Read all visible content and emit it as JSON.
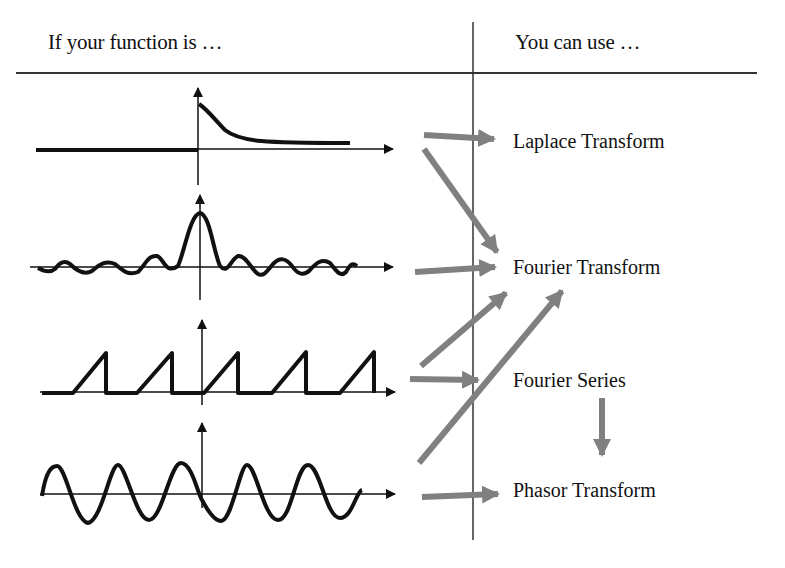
{
  "header": {
    "left": "If your function is …",
    "right": "You can use …"
  },
  "functions": [
    {
      "name": "decaying-exponential",
      "label": "One-sided decaying exponential (causal)"
    },
    {
      "name": "sinc",
      "label": "Sinc pulse (aperiodic)"
    },
    {
      "name": "periodic-sawtooth",
      "label": "Periodic sawtooth pulses"
    },
    {
      "name": "sinusoid",
      "label": "Sinusoid"
    }
  ],
  "transforms": [
    {
      "name": "laplace",
      "label": "Laplace Transform"
    },
    {
      "name": "fourier-transform",
      "label": "Fourier Transform"
    },
    {
      "name": "fourier-series",
      "label": "Fourier Series"
    },
    {
      "name": "phasor",
      "label": "Phasor Transform"
    }
  ],
  "arrows": [
    {
      "from": "decaying-exponential",
      "to": "laplace"
    },
    {
      "from": "decaying-exponential",
      "to": "fourier-transform"
    },
    {
      "from": "sinc",
      "to": "fourier-transform"
    },
    {
      "from": "periodic-sawtooth",
      "to": "fourier-transform"
    },
    {
      "from": "periodic-sawtooth",
      "to": "fourier-series"
    },
    {
      "from": "sinusoid",
      "to": "fourier-transform"
    },
    {
      "from": "sinusoid",
      "to": "phasor"
    },
    {
      "from": "fourier-series",
      "to": "phasor"
    }
  ],
  "colors": {
    "ink": "#111111",
    "arrow": "#808080",
    "rule": "#333333"
  }
}
